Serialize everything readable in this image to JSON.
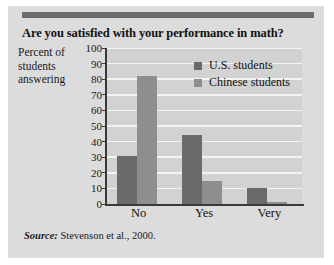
{
  "figure": {
    "source_label": "Source:",
    "source_text": "Stevenson et al., 2000."
  },
  "chart_data": {
    "type": "bar",
    "title": "Are you satisfied with your performance in math?",
    "xlabel": "",
    "ylabel": "Percent of students answering",
    "categories": [
      "No",
      "Yes",
      "Very"
    ],
    "series": [
      {
        "name": "U.S. students",
        "color": "#6a6a6a",
        "values": [
          31,
          44,
          10
        ]
      },
      {
        "name": "Chinese students",
        "color": "#8e8e8e",
        "values": [
          82,
          15,
          1
        ]
      }
    ],
    "ylim": [
      0,
      100
    ],
    "yticks": [
      0,
      10,
      20,
      30,
      40,
      50,
      60,
      70,
      80,
      90,
      100
    ],
    "grid": true,
    "legend_position": "upper-right"
  }
}
